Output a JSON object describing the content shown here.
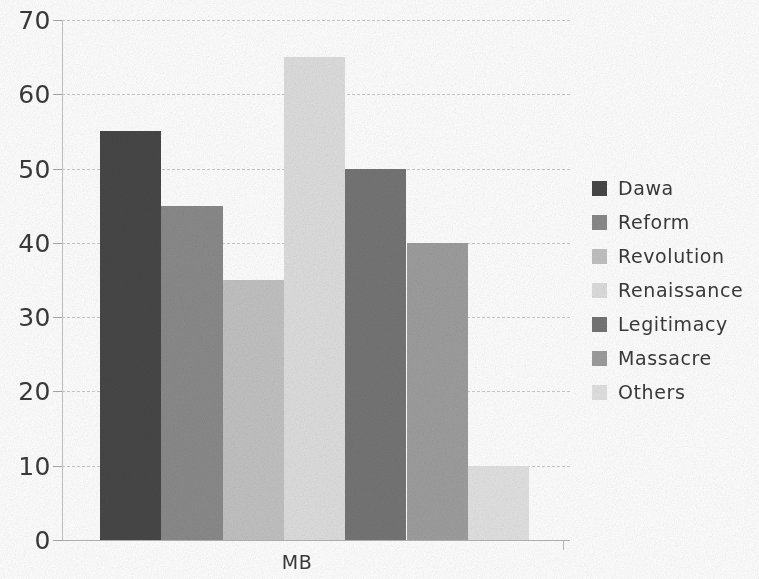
{
  "chart_data": {
    "type": "bar",
    "title": "",
    "subtitle": "",
    "xlabel": "MB",
    "ylabel": "",
    "categories": [
      "MB"
    ],
    "series": [
      {
        "name": "Dawa",
        "values": [
          55
        ],
        "color": "#474747"
      },
      {
        "name": "Reform",
        "values": [
          45
        ],
        "color": "#8a8a8a"
      },
      {
        "name": "Revolution",
        "values": [
          35
        ],
        "color": "#c2c2c2"
      },
      {
        "name": "Renaissance",
        "values": [
          65
        ],
        "color": "#dedede"
      },
      {
        "name": "Legitimacy",
        "values": [
          50
        ],
        "color": "#757575"
      },
      {
        "name": "Massacre",
        "values": [
          40
        ],
        "color": "#9e9e9e"
      },
      {
        "name": "Others",
        "values": [
          10
        ],
        "color": "#e2e2e2"
      }
    ],
    "ylim": [
      0,
      70
    ],
    "ytick_step": 10,
    "yticks": [
      70,
      60,
      50,
      40,
      30,
      20,
      10,
      0
    ],
    "ytick_labels": [
      "70",
      "60",
      "50",
      "40",
      "30",
      "20",
      "10",
      "0"
    ],
    "grid": true,
    "grid_axis": "y",
    "grid_style": "dashed",
    "grid_color": "#c9c9c9",
    "legend": true,
    "legend_position": "right",
    "background_color": "#ffffff",
    "text_color": "#3a3a3a"
  },
  "axis": {
    "x_label": "MB"
  },
  "legend": {
    "entries": [
      {
        "label": "Dawa",
        "color": "#474747"
      },
      {
        "label": "Reform",
        "color": "#8a8a8a"
      },
      {
        "label": "Revolution",
        "color": "#c2c2c2"
      },
      {
        "label": "Renaissance",
        "color": "#dedede"
      },
      {
        "label": "Legitimacy",
        "color": "#757575"
      },
      {
        "label": "Massacre",
        "color": "#9e9e9e"
      },
      {
        "label": "Others",
        "color": "#e2e2e2"
      }
    ]
  }
}
